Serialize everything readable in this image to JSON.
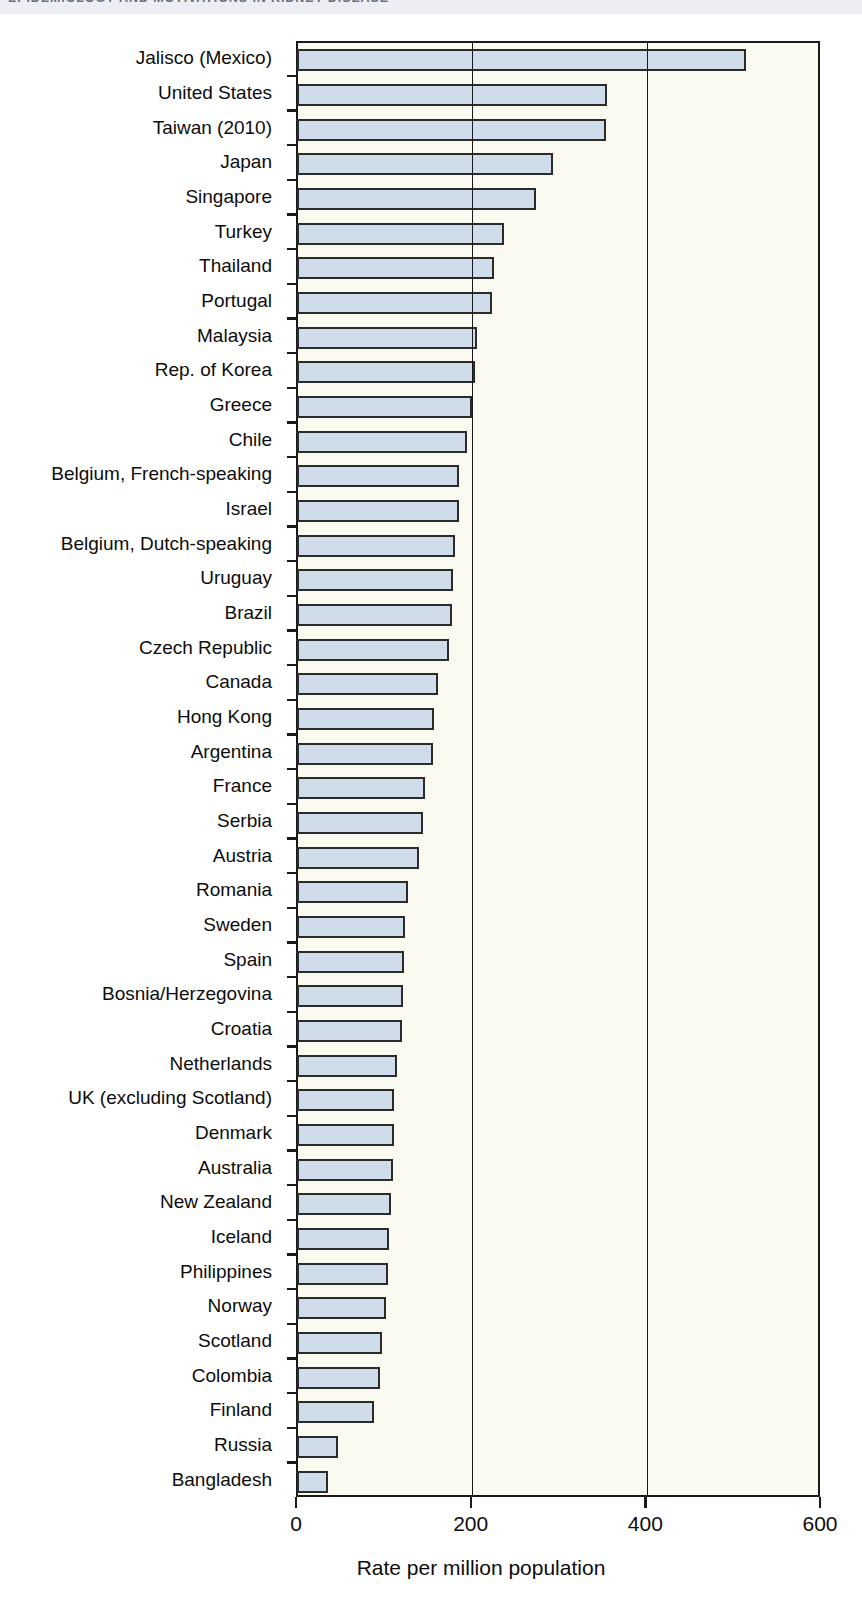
{
  "header": {
    "running_title": "EPIDEMIOLOGY AND MOTIVATIONS IN KIDNEY DISEASE"
  },
  "chart_data": {
    "type": "bar",
    "orientation": "horizontal",
    "title": "",
    "xlabel": "Rate per million population",
    "ylabel": "",
    "xlim": [
      0,
      600
    ],
    "xticks": [
      0,
      200,
      400,
      600
    ],
    "xtick_labels": [
      "0",
      "200",
      "400",
      "600"
    ],
    "grid": true,
    "grid_axis": "x",
    "bar_fill_color": "#cfdcea",
    "bar_edge_color": "#2b2b2b",
    "plot_background": "#fbfaf0",
    "categories": [
      "Jalisco (Mexico)",
      "United States",
      "Taiwan (2010)",
      "Japan",
      "Singapore",
      "Turkey",
      "Thailand",
      "Portugal",
      "Malaysia",
      "Rep. of Korea",
      "Greece",
      "Chile",
      "Belgium, French-speaking",
      "Israel",
      "Belgium, Dutch-speaking",
      "Uruguay",
      "Brazil",
      "Czech Republic",
      "Canada",
      "Hong Kong",
      "Argentina",
      "France",
      "Serbia",
      "Austria",
      "Romania",
      "Sweden",
      "Spain",
      "Bosnia/Herzegovina",
      "Croatia",
      "Netherlands",
      "UK (excluding Scotland)",
      "Denmark",
      "Australia",
      "New Zealand",
      "Iceland",
      "Philippines",
      "Norway",
      "Scotland",
      "Colombia",
      "Finland",
      "Russia",
      "Bangladesh"
    ],
    "values": [
      514,
      355,
      354,
      293,
      274,
      237,
      225,
      223,
      206,
      204,
      200,
      195,
      186,
      185,
      181,
      179,
      178,
      174,
      161,
      157,
      156,
      147,
      144,
      140,
      127,
      124,
      122,
      121,
      120,
      115,
      111,
      111,
      110,
      108,
      105,
      104,
      102,
      97,
      95,
      88,
      47,
      36
    ]
  }
}
